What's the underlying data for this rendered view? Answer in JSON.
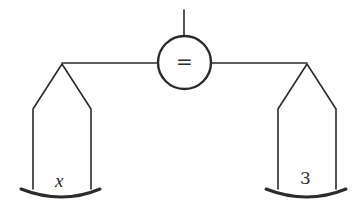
{
  "diagram": {
    "type": "balance-scale",
    "center_symbol": "=",
    "left_pan": {
      "label": "x"
    },
    "right_pan": {
      "label": "3"
    },
    "colors": {
      "stroke": "#2b2b2b",
      "background": "#ffffff"
    }
  }
}
